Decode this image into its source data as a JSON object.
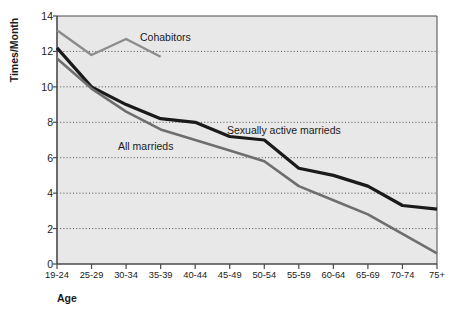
{
  "chart_data": {
    "type": "line",
    "title": "",
    "xlabel": "Age",
    "ylabel": "Times/Month",
    "categories": [
      "19-24",
      "25-29",
      "30-34",
      "35-39",
      "40-44",
      "45-49",
      "50-54",
      "55-59",
      "60-64",
      "65-69",
      "70-74",
      "75+"
    ],
    "ylim": [
      0,
      14
    ],
    "yticks": [
      0,
      2,
      4,
      6,
      8,
      10,
      12,
      14
    ],
    "grid": "horizontal-dotted",
    "legend_position": "inline-annotations",
    "plot_background": "#e8e8e8",
    "series": [
      {
        "name": "Cohabitors",
        "color": "#8c8c8c",
        "width": 2.4,
        "values": [
          13.2,
          11.8,
          12.7,
          11.7,
          null,
          null,
          null,
          null,
          null,
          null,
          null,
          null
        ]
      },
      {
        "name": "Sexually active marrieds",
        "color": "#1a1a1a",
        "width": 3.2,
        "values": [
          12.2,
          10.0,
          9.0,
          8.2,
          8.0,
          7.2,
          7.0,
          5.4,
          5.0,
          4.4,
          3.3,
          3.1
        ]
      },
      {
        "name": "All marrieds",
        "color": "#6e6e6e",
        "width": 2.6,
        "values": [
          11.6,
          9.9,
          8.6,
          7.6,
          7.0,
          6.4,
          5.8,
          4.4,
          3.6,
          2.8,
          1.7,
          0.6
        ]
      }
    ],
    "annotations": [
      {
        "text": "Cohabitors",
        "x": 140,
        "y": 31
      },
      {
        "text": "Sexually active marrieds",
        "x": 227,
        "y": 124
      },
      {
        "text": "All marrieds",
        "x": 118,
        "y": 140
      }
    ]
  },
  "axis": {
    "y_title": "Times/Month",
    "x_title": "Age",
    "y_tick_labels": [
      "0",
      "2",
      "4",
      "6",
      "8",
      "10",
      "12",
      "14"
    ],
    "x_tick_labels": [
      "19-24",
      "25-29",
      "30-34",
      "35-39",
      "40-44",
      "45-49",
      "50-54",
      "55-59",
      "60-64",
      "65-69",
      "70-74",
      "75+"
    ]
  }
}
